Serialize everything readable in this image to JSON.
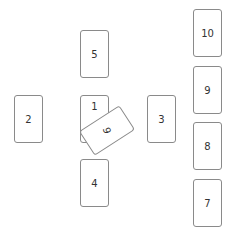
{
  "diagram": {
    "type": "card-spread",
    "cards": [
      {
        "id": "1",
        "label": "1",
        "x": 80,
        "y": 95,
        "orientation": "upright"
      },
      {
        "id": "2",
        "label": "2",
        "x": 14,
        "y": 95,
        "orientation": "upright"
      },
      {
        "id": "3",
        "label": "3",
        "x": 147,
        "y": 95,
        "orientation": "upright"
      },
      {
        "id": "4",
        "label": "4",
        "x": 80,
        "y": 159,
        "orientation": "upright"
      },
      {
        "id": "5",
        "label": "5",
        "x": 80,
        "y": 30,
        "orientation": "upright"
      },
      {
        "id": "6",
        "label": "6",
        "x": 84,
        "y": 116,
        "orientation": "crossing-rotated"
      },
      {
        "id": "7",
        "label": "7",
        "x": 193,
        "y": 179,
        "orientation": "upright"
      },
      {
        "id": "8",
        "label": "8",
        "x": 193,
        "y": 122,
        "orientation": "upright"
      },
      {
        "id": "9",
        "label": "9",
        "x": 193,
        "y": 66,
        "orientation": "upright"
      },
      {
        "id": "10",
        "label": "10",
        "x": 193,
        "y": 9,
        "orientation": "upright"
      }
    ],
    "colors": {
      "border": "#8a8a8a",
      "text": "#333333",
      "background": "#ffffff"
    }
  }
}
